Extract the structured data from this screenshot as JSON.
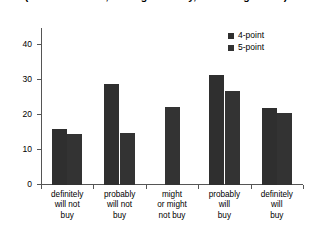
{
  "chart_data": {
    "type": "bar",
    "title": "(new toothbrush, flashlight battery, electric light bulb)",
    "title_lines": [
      "(new toothbrush, flashlight battery, electric light bulb)"
    ],
    "xlabel": "",
    "ylabel": "",
    "ylim": [
      0,
      45
    ],
    "yticks": [
      0,
      10,
      20,
      30,
      40
    ],
    "ytick_labels": [
      "0",
      "10",
      "20",
      "30",
      "40"
    ],
    "grid": false,
    "legend_position": "top-right",
    "categories": [
      "definitely will not buy",
      "probably will not buy",
      "might or might not buy",
      "probably will buy",
      "definitely will buy"
    ],
    "category_lines": [
      [
        "definitely",
        "will not",
        "buy"
      ],
      [
        "probably",
        "will not",
        "buy"
      ],
      [
        "might",
        "or might",
        "not buy"
      ],
      [
        "probably",
        "will",
        "buy"
      ],
      [
        "definitely",
        "will",
        "buy"
      ]
    ],
    "series": [
      {
        "name": "4-point",
        "color": "#2f2f2f",
        "values": [
          16,
          29,
          null,
          31.5,
          22
        ]
      },
      {
        "name": "5-point",
        "color": "#333333",
        "values": [
          14.5,
          15,
          22.5,
          27,
          20.5
        ]
      }
    ]
  },
  "legend": {
    "items": [
      {
        "label": "4-point",
        "color": "#2f2f2f"
      },
      {
        "label": "5-point",
        "color": "#333333"
      }
    ]
  },
  "colors": {
    "series_4point": "#2f2f2f",
    "series_5point": "#333333",
    "axis": "#555555",
    "text": "#000000",
    "background": "#ffffff"
  }
}
